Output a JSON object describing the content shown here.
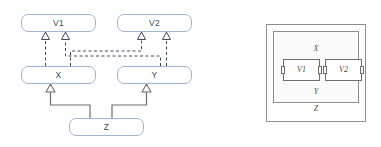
{
  "figure": {
    "title": "",
    "panels": [
      "uml-inheritance-diagram",
      "nesting-containment-diagram"
    ]
  },
  "left_diagram": {
    "name": "uml-class-diagram",
    "nodes": [
      {
        "id": "v1",
        "label": "V1",
        "row": "top",
        "shape": "rounded-rectangle"
      },
      {
        "id": "v2",
        "label": "V2",
        "row": "top",
        "shape": "rounded-rectangle"
      },
      {
        "id": "x",
        "label": "X",
        "row": "middle",
        "shape": "rounded-rectangle"
      },
      {
        "id": "y",
        "label": "Y",
        "row": "middle",
        "shape": "rounded-rectangle"
      },
      {
        "id": "z",
        "label": "Z",
        "row": "bottom",
        "shape": "rounded-rectangle"
      }
    ],
    "edges": [
      {
        "from": "x",
        "to": "v1",
        "style": "dashed",
        "arrow": "hollow-triangle"
      },
      {
        "from": "x",
        "to": "v2",
        "style": "dashed",
        "arrow": "hollow-triangle"
      },
      {
        "from": "y",
        "to": "v1",
        "style": "dashed",
        "arrow": "hollow-triangle"
      },
      {
        "from": "y",
        "to": "v2",
        "style": "dashed",
        "arrow": "hollow-triangle"
      },
      {
        "from": "z",
        "to": "x",
        "style": "solid",
        "arrow": "hollow-triangle"
      },
      {
        "from": "z",
        "to": "y",
        "style": "solid",
        "arrow": "hollow-triangle"
      }
    ],
    "colors": {
      "box_border": "#9fb6d4",
      "box_fill": "#ffffff",
      "label_text": "#3d4a5c",
      "dashed_edge": "#3d4a5c",
      "solid_edge": "#6f6f6f"
    }
  },
  "right_diagram": {
    "name": "nesting-diagram",
    "outer_label": "Z",
    "middle_labels": {
      "top": "X",
      "bottom": "Y"
    },
    "inner_boxes": [
      {
        "id": "v1",
        "label": "V1",
        "ports": [
          "left",
          "right"
        ]
      },
      {
        "id": "v2",
        "label": "V2",
        "ports": [
          "left",
          "right"
        ]
      }
    ],
    "colors": {
      "border": "#8d8d8d",
      "inner_border": "#6e6e6e",
      "fill": "#ffffff",
      "mid_fill": "#fbfbfb",
      "label_text": "#555555"
    }
  }
}
